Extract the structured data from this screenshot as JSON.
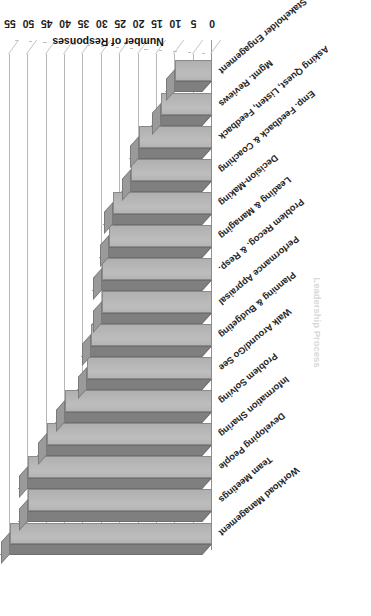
{
  "chart_data": {
    "type": "bar",
    "orientation": "horizontal-3d",
    "title": "",
    "xlabel": "Leadership Process",
    "ylabel": "Number of Responses",
    "ylim": [
      0,
      55
    ],
    "ytick_step": 5,
    "grid": true,
    "legend": false,
    "rotation_note": "image is presented rotated 180 degrees",
    "tick_labels": [
      "0",
      "5",
      "10",
      "15",
      "20",
      "25",
      "30",
      "35",
      "40",
      "45",
      "50",
      "55"
    ],
    "tick_values": [
      0,
      5,
      10,
      15,
      20,
      25,
      30,
      35,
      40,
      45,
      50,
      55
    ],
    "categories": [
      "Workload Management",
      "Team Meetings",
      "Developing People",
      "Information Sharing",
      "Problem Solving",
      "Walk Around/Go See",
      "Planning & Budgeting",
      "Performance Appraisal",
      "Problem Recog. & Resp.",
      "Leading & Managing",
      "Decision-Making",
      "Emp. Feedback & Coaching",
      "Asking Quest, Listen, Feedback",
      "Mgmt. Reviews",
      "Stakeholder Engagement"
    ],
    "values": [
      55,
      50,
      50,
      45,
      40,
      34,
      33,
      30,
      30,
      28,
      27,
      22,
      20,
      14,
      10
    ]
  },
  "colors": {
    "bar_face": "#b8b8b8",
    "bar_top": "#7f7f7f",
    "bar_side": "#9a9a9a",
    "bar_outline": "#8a8a8a",
    "gridline": "#b7b7b7",
    "text": "#1b1b1b",
    "background": "#ffffff"
  }
}
